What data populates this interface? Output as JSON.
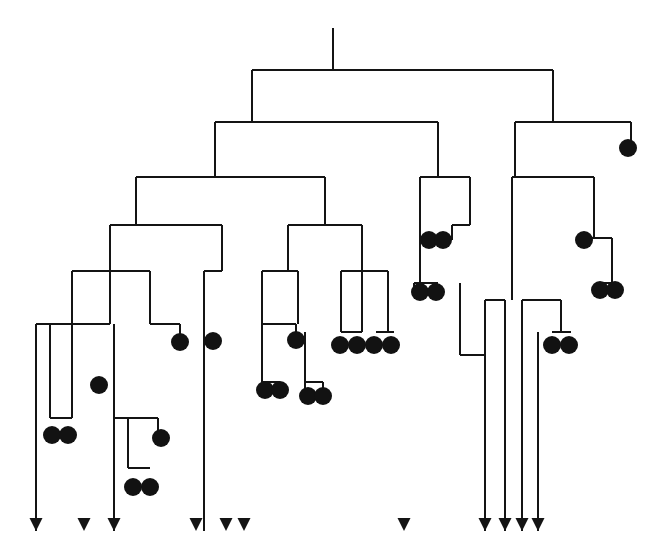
{
  "figure": {
    "kind": "cladogram",
    "width": 666,
    "height": 555,
    "background_color": "#ffffff",
    "line_color": "#141414",
    "node_color": "#121212",
    "line_width": 2,
    "dot_radius": 9,
    "counts": {
      "terminal_dots": 27,
      "terminal_arrows": 11,
      "internal_branch_levels": 9
    },
    "legend_note_visible": false
  },
  "chart_data": {
    "type": "tree",
    "title": "",
    "xlabel": "",
    "ylabel": "",
    "root": {
      "stem_x": 333,
      "stem_top_y": 28,
      "stem_bottom_y": 70
    },
    "branches": [
      {
        "id": "b-root",
        "y": 70,
        "x1": 252,
        "x2": 553
      },
      {
        "id": "b-L1",
        "y": 122,
        "x1": 215,
        "x2": 438
      },
      {
        "id": "b-R1",
        "y": 122,
        "x1": 515,
        "x2": 631
      },
      {
        "id": "b-L2",
        "y": 177,
        "x1": 136,
        "x2": 325
      },
      {
        "id": "b-R2",
        "y": 177,
        "x1": 420,
        "x2": 470
      },
      {
        "id": "b-R3",
        "y": 177,
        "x1": 512,
        "x2": 594
      },
      {
        "id": "b-L3",
        "y": 225,
        "x1": 110,
        "x2": 222
      },
      {
        "id": "b-M3",
        "y": 225,
        "x1": 288,
        "x2": 362
      },
      {
        "id": "b-R4",
        "y": 225,
        "x1": 452,
        "x2": 470
      },
      {
        "id": "b-R5",
        "y": 238,
        "x1": 580,
        "x2": 612
      },
      {
        "id": "b-L4",
        "y": 271,
        "x1": 72,
        "x2": 150
      },
      {
        "id": "b-L5",
        "y": 271,
        "x1": 204,
        "x2": 222
      },
      {
        "id": "b-M4",
        "y": 271,
        "x1": 262,
        "x2": 298
      },
      {
        "id": "b-M5",
        "y": 271,
        "x1": 341,
        "x2": 388
      },
      {
        "id": "b-M6",
        "y": 283,
        "x1": 414,
        "x2": 438
      },
      {
        "id": "b-R6",
        "y": 283,
        "x1": 597,
        "x2": 615
      },
      {
        "id": "b-L6",
        "y": 324,
        "x1": 36,
        "x2": 110
      },
      {
        "id": "b-L7",
        "y": 324,
        "x1": 150,
        "x2": 180
      },
      {
        "id": "b-M7",
        "y": 324,
        "x1": 262,
        "x2": 296
      },
      {
        "id": "b-M8a",
        "y": 332,
        "x1": 341,
        "x2": 362
      },
      {
        "id": "b-M8b",
        "y": 332,
        "x1": 376,
        "x2": 394
      },
      {
        "id": "b-R7a",
        "y": 300,
        "x1": 485,
        "x2": 505
      },
      {
        "id": "b-R7b",
        "y": 300,
        "x1": 522,
        "x2": 561
      },
      {
        "id": "b-R8",
        "y": 332,
        "x1": 552,
        "x2": 571
      },
      {
        "id": "b-L8",
        "y": 418,
        "x1": 50,
        "x2": 72
      },
      {
        "id": "b-L9",
        "y": 418,
        "x1": 114,
        "x2": 158
      },
      {
        "id": "b-M9",
        "y": 382,
        "x1": 262,
        "x2": 280
      },
      {
        "id": "b-M10",
        "y": 382,
        "x1": 305,
        "x2": 323
      },
      {
        "id": "b-L10",
        "y": 468,
        "x1": 128,
        "x2": 150
      },
      {
        "id": "b-R9",
        "y": 355,
        "x1": 460,
        "x2": 485
      }
    ],
    "terminal_dots": [
      {
        "id": "d01",
        "x": 628,
        "y": 148
      },
      {
        "id": "d02",
        "x": 429,
        "y": 240
      },
      {
        "id": "d03",
        "x": 443,
        "y": 240
      },
      {
        "id": "d04",
        "x": 584,
        "y": 240
      },
      {
        "id": "d05",
        "x": 600,
        "y": 290
      },
      {
        "id": "d06",
        "x": 615,
        "y": 290
      },
      {
        "id": "d07",
        "x": 420,
        "y": 292
      },
      {
        "id": "d08",
        "x": 436,
        "y": 292
      },
      {
        "id": "d09",
        "x": 180,
        "y": 342
      },
      {
        "id": "d10",
        "x": 213,
        "y": 341
      },
      {
        "id": "d11",
        "x": 296,
        "y": 340
      },
      {
        "id": "d12",
        "x": 340,
        "y": 345
      },
      {
        "id": "d13",
        "x": 357,
        "y": 345
      },
      {
        "id": "d14",
        "x": 374,
        "y": 345
      },
      {
        "id": "d15",
        "x": 391,
        "y": 345
      },
      {
        "id": "d16",
        "x": 552,
        "y": 345
      },
      {
        "id": "d17",
        "x": 569,
        "y": 345
      },
      {
        "id": "d18",
        "x": 99,
        "y": 385
      },
      {
        "id": "d19",
        "x": 265,
        "y": 390
      },
      {
        "id": "d20",
        "x": 280,
        "y": 390
      },
      {
        "id": "d21",
        "x": 308,
        "y": 396
      },
      {
        "id": "d22",
        "x": 323,
        "y": 396
      },
      {
        "id": "d23",
        "x": 52,
        "y": 435
      },
      {
        "id": "d24",
        "x": 68,
        "y": 435
      },
      {
        "id": "d25",
        "x": 161,
        "y": 438
      },
      {
        "id": "d26",
        "x": 133,
        "y": 487
      },
      {
        "id": "d27",
        "x": 150,
        "y": 487
      }
    ],
    "terminal_arrows": [
      {
        "id": "a01",
        "x": 36,
        "tip_y": 531
      },
      {
        "id": "a02",
        "x": 84,
        "tip_y": 531
      },
      {
        "id": "a03",
        "x": 114,
        "tip_y": 531
      },
      {
        "id": "a04",
        "x": 196,
        "tip_y": 531
      },
      {
        "id": "a05",
        "x": 226,
        "tip_y": 531
      },
      {
        "id": "a06",
        "x": 244,
        "tip_y": 531
      },
      {
        "id": "a07",
        "x": 404,
        "tip_y": 531
      },
      {
        "id": "a08",
        "x": 485,
        "tip_y": 531
      },
      {
        "id": "a09",
        "x": 505,
        "tip_y": 531
      },
      {
        "id": "a10",
        "x": 522,
        "tip_y": 531
      },
      {
        "id": "a11",
        "x": 538,
        "tip_y": 531
      }
    ],
    "verticals": [
      {
        "id": "v-root-stem",
        "x": 333,
        "y1": 28,
        "y2": 70
      },
      {
        "id": "v01",
        "x": 252,
        "y1": 70,
        "y2": 122
      },
      {
        "id": "v02",
        "x": 553,
        "y1": 70,
        "y2": 122
      },
      {
        "id": "v03",
        "x": 215,
        "y1": 122,
        "y2": 177
      },
      {
        "id": "v04",
        "x": 438,
        "y1": 122,
        "y2": 177
      },
      {
        "id": "v05",
        "x": 515,
        "y1": 122,
        "y2": 177
      },
      {
        "id": "v06",
        "x": 631,
        "y1": 122,
        "y2": 148
      },
      {
        "id": "v07",
        "x": 136,
        "y1": 177,
        "y2": 225
      },
      {
        "id": "v08",
        "x": 325,
        "y1": 177,
        "y2": 225
      },
      {
        "id": "v09",
        "x": 420,
        "y1": 177,
        "y2": 292
      },
      {
        "id": "v10",
        "x": 470,
        "y1": 177,
        "y2": 225
      },
      {
        "id": "v11",
        "x": 512,
        "y1": 177,
        "y2": 300
      },
      {
        "id": "v12",
        "x": 594,
        "y1": 177,
        "y2": 238
      },
      {
        "id": "v13",
        "x": 110,
        "y1": 225,
        "y2": 324
      },
      {
        "id": "v14",
        "x": 222,
        "y1": 225,
        "y2": 271
      },
      {
        "id": "v15",
        "x": 288,
        "y1": 225,
        "y2": 271
      },
      {
        "id": "v16",
        "x": 362,
        "y1": 225,
        "y2": 332
      },
      {
        "id": "v17",
        "x": 452,
        "y1": 225,
        "y2": 240
      },
      {
        "id": "v18",
        "x": 580,
        "y1": 238,
        "y2": 240
      },
      {
        "id": "v19",
        "x": 612,
        "y1": 238,
        "y2": 283
      },
      {
        "id": "v20",
        "x": 72,
        "y1": 271,
        "y2": 418
      },
      {
        "id": "v21",
        "x": 150,
        "y1": 271,
        "y2": 324
      },
      {
        "id": "v22",
        "x": 204,
        "y1": 271,
        "y2": 531
      },
      {
        "id": "v23",
        "x": 262,
        "y1": 271,
        "y2": 382
      },
      {
        "id": "v24",
        "x": 298,
        "y1": 271,
        "y2": 324
      },
      {
        "id": "v25",
        "x": 341,
        "y1": 271,
        "y2": 332
      },
      {
        "id": "v26",
        "x": 388,
        "y1": 271,
        "y2": 332
      },
      {
        "id": "v27",
        "x": 414,
        "y1": 283,
        "y2": 292
      },
      {
        "id": "v28",
        "x": 597,
        "y1": 283,
        "y2": 290
      },
      {
        "id": "v29",
        "x": 36,
        "y1": 324,
        "y2": 531
      },
      {
        "id": "v30",
        "x": 50,
        "y1": 324,
        "y2": 418
      },
      {
        "id": "v31",
        "x": 180,
        "y1": 324,
        "y2": 342
      },
      {
        "id": "v32",
        "x": 296,
        "y1": 324,
        "y2": 340
      },
      {
        "id": "v33",
        "x": 485,
        "y1": 300,
        "y2": 531
      },
      {
        "id": "v34",
        "x": 505,
        "y1": 300,
        "y2": 531
      },
      {
        "id": "v35",
        "x": 522,
        "y1": 300,
        "y2": 531
      },
      {
        "id": "v36",
        "x": 561,
        "y1": 300,
        "y2": 332
      },
      {
        "id": "v37",
        "x": 114,
        "y1": 324,
        "y2": 531
      },
      {
        "id": "v38",
        "x": 158,
        "y1": 418,
        "y2": 438
      },
      {
        "id": "v39",
        "x": 128,
        "y1": 418,
        "y2": 468
      },
      {
        "id": "v40",
        "x": 280,
        "y1": 382,
        "y2": 390
      },
      {
        "id": "v41",
        "x": 305,
        "y1": 332,
        "y2": 396
      },
      {
        "id": "v42",
        "x": 323,
        "y1": 382,
        "y2": 396
      },
      {
        "id": "v43",
        "x": 460,
        "y1": 283,
        "y2": 355
      },
      {
        "id": "v44",
        "x": 538,
        "y1": 332,
        "y2": 531
      }
    ]
  }
}
